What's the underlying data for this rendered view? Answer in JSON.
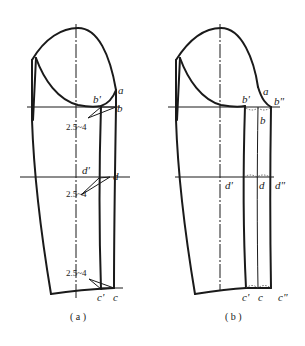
{
  "figure": {
    "panels": [
      {
        "id": "a",
        "caption": "( a )",
        "points": {
          "a": "a",
          "b": "b",
          "b_prime": "b'",
          "d": "d",
          "d_prime": "d'",
          "c": "c",
          "c_prime": "c'"
        },
        "measurements": [
          "2.5~4",
          "2.5~4",
          "2.5~4"
        ]
      },
      {
        "id": "b",
        "caption": "( b )",
        "points": {
          "a": "a",
          "b": "b",
          "b_prime": "b'",
          "b_double_prime": "b\"",
          "d": "d",
          "d_prime": "d'",
          "d_double_prime": "d\"",
          "c": "c",
          "c_prime": "c'",
          "c_double_prime": "c\""
        }
      }
    ],
    "colors": {
      "line": "#1a1a1a",
      "background": "#ffffff"
    }
  }
}
